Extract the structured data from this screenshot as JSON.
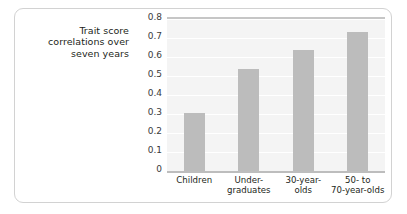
{
  "chart_data": {
    "type": "bar",
    "title": "",
    "xlabel": "",
    "ylabel": "Trait score correlations over seven years",
    "ylabel_lines": [
      "Trait score",
      "correlations over",
      "seven years"
    ],
    "categories": [
      "Children",
      "Under-graduates",
      "30-year-olds",
      "50- to 70-year-olds"
    ],
    "category_lines": [
      [
        "Children"
      ],
      [
        "Under-",
        "graduates"
      ],
      [
        "30-year-",
        "olds"
      ],
      [
        "50-  to",
        "70-year-olds"
      ]
    ],
    "values": [
      0.305,
      0.535,
      0.635,
      0.73
    ],
    "ylim": [
      0,
      0.8
    ],
    "ytick_labels": [
      "0.8",
      "0.7",
      "0.6",
      "0.5",
      "0.4",
      "0.3",
      "0.2",
      "0.1",
      "0"
    ],
    "ytick_values": [
      0.8,
      0.7,
      0.6,
      0.5,
      0.4,
      0.3,
      0.2,
      0.1,
      0
    ],
    "grid": true,
    "legend": false,
    "bar_color": "#bcbcbc",
    "plot_background": "#f4f4f4",
    "gridline_color": "#ffffff",
    "axis_color": "#bdbdbd",
    "card_border_color": "#d2d2d2",
    "text_color": "#231f20"
  }
}
